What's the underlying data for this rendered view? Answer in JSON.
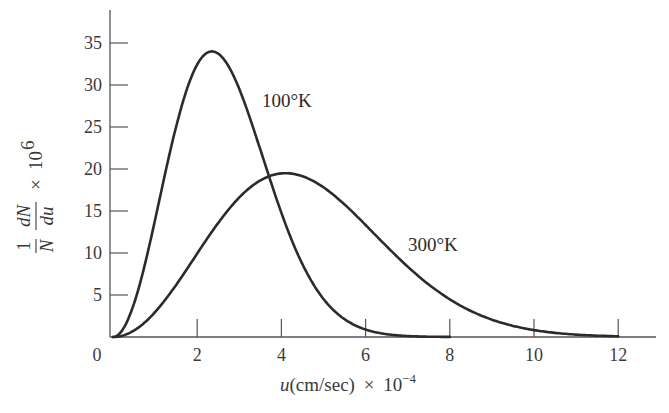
{
  "chart_data": {
    "type": "line",
    "title": "",
    "xlabel": "u(cm/sec) × 10^-4",
    "xlabel_parts": {
      "var": "u",
      "unit": "(cm/sec)",
      "times": "×",
      "base": "10",
      "exp": "−4"
    },
    "ylabel": "(1/N)(dN/du) × 10^6",
    "ylabel_parts": {
      "one": "1",
      "N": "N",
      "dN": "dN",
      "du": "du",
      "times": "×",
      "base": "10",
      "exp": "6"
    },
    "xlim": [
      0,
      13
    ],
    "ylim": [
      0,
      38
    ],
    "x_ticks": [
      0,
      2,
      4,
      6,
      8,
      10,
      12
    ],
    "x_tick_labels": [
      "0",
      "2",
      "4",
      "6",
      "8",
      "10",
      "12"
    ],
    "y_ticks": [
      5,
      10,
      15,
      20,
      25,
      30,
      35
    ],
    "y_tick_labels": [
      "5",
      "10",
      "15",
      "20",
      "25",
      "30",
      "35"
    ],
    "grid": false,
    "legend": "none (curves labeled inline)",
    "series": [
      {
        "name": "100°K",
        "label": "100°K",
        "peak": {
          "u": 2.35,
          "value": 34
        },
        "x": [
          0,
          0.5,
          1,
          1.5,
          2,
          2.35,
          3,
          3.5,
          4,
          5,
          6,
          7,
          8
        ],
        "values": [
          0,
          4.0,
          14.0,
          25.0,
          32.4,
          34.0,
          29.5,
          22.3,
          14.8,
          4.5,
          0.9,
          0.12,
          0.01
        ]
      },
      {
        "name": "300°K",
        "label": "300°K",
        "peak": {
          "u": 4.1,
          "value": 19.5
        },
        "x": [
          0,
          1,
          2,
          3,
          4,
          5,
          6,
          7,
          8,
          9,
          10,
          11,
          12
        ],
        "values": [
          0,
          3.0,
          10.1,
          16.8,
          19.5,
          17.8,
          13.2,
          8.2,
          4.3,
          2.0,
          0.8,
          0.26,
          0.08
        ]
      }
    ]
  }
}
